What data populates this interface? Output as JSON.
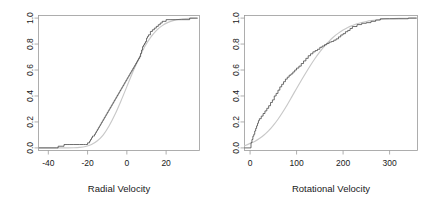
{
  "figure": {
    "background": "#ffffff",
    "ecdf_color": "#3d3d3d",
    "fitted_color": "#c8c8c8",
    "axis_color": "#9a9a9a"
  },
  "chart_data": [
    {
      "type": "line",
      "panel": "left",
      "title": "",
      "xlabel": "Radial Velocity",
      "ylabel": "",
      "xlim": [
        -45,
        37
      ],
      "ylim": [
        -0.02,
        1.02
      ],
      "xticks": [
        -40,
        -20,
        0,
        20
      ],
      "xticklabels": [
        "-40",
        "-20",
        "0",
        "20"
      ],
      "yticks": [
        0.0,
        0.2,
        0.4,
        0.6,
        0.8,
        1.0
      ],
      "yticklabels": [
        "0.0",
        "0.2",
        "0.4",
        "0.6",
        "0.8",
        "1.0"
      ],
      "grid": false,
      "legend": "none",
      "series": [
        {
          "name": "Empirical CDF",
          "kind": "step",
          "color": "#3d3d3d",
          "x": [
            -45,
            -36,
            -35,
            -33,
            -32,
            -31,
            -30,
            -29,
            -27,
            -24,
            -22,
            -21,
            -20,
            -19,
            -18.5,
            -18,
            -17.5,
            -17,
            -16.5,
            -16,
            -15.5,
            -15,
            -14.5,
            -14,
            -13.5,
            -13,
            -12.5,
            -12,
            -11.5,
            -11,
            -10.5,
            -10,
            -9.5,
            -9,
            -8.5,
            -8,
            -7.5,
            -7,
            -6.5,
            -6,
            -5.5,
            -5,
            -4.5,
            -4,
            -3.5,
            -3,
            -2.5,
            -2,
            -1.5,
            -1,
            -0.5,
            0,
            0.5,
            1,
            1.5,
            2,
            2.5,
            3,
            3.5,
            4,
            4.5,
            5,
            5.5,
            6,
            6.5,
            7,
            7.5,
            8,
            8.5,
            9,
            9.5,
            10,
            10.5,
            11,
            12,
            13,
            14,
            15,
            16,
            17,
            18,
            20,
            22,
            25,
            28,
            32,
            36
          ],
          "y": [
            0.0,
            0.0,
            0.013,
            0.013,
            0.026,
            0.026,
            0.026,
            0.026,
            0.026,
            0.026,
            0.026,
            0.026,
            0.039,
            0.052,
            0.065,
            0.078,
            0.091,
            0.091,
            0.104,
            0.117,
            0.13,
            0.143,
            0.156,
            0.169,
            0.182,
            0.195,
            0.208,
            0.221,
            0.234,
            0.247,
            0.26,
            0.273,
            0.286,
            0.299,
            0.312,
            0.325,
            0.338,
            0.351,
            0.364,
            0.377,
            0.39,
            0.403,
            0.416,
            0.429,
            0.442,
            0.455,
            0.468,
            0.481,
            0.494,
            0.507,
            0.52,
            0.533,
            0.546,
            0.559,
            0.572,
            0.585,
            0.598,
            0.611,
            0.624,
            0.637,
            0.65,
            0.663,
            0.676,
            0.689,
            0.702,
            0.728,
            0.754,
            0.78,
            0.793,
            0.806,
            0.819,
            0.845,
            0.858,
            0.871,
            0.897,
            0.91,
            0.923,
            0.936,
            0.949,
            0.962,
            0.975,
            0.988,
            0.988,
            0.988,
            0.988,
            1.0,
            1.0
          ]
        },
        {
          "name": "Fitted Normal CDF",
          "kind": "smooth",
          "color": "#c8c8c8",
          "mean": -0.6,
          "sd": 8.6,
          "x": [
            -45,
            -42,
            -39,
            -36,
            -33,
            -30,
            -27,
            -24,
            -21,
            -18,
            -15,
            -12,
            -9,
            -6,
            -3,
            0,
            3,
            6,
            9,
            12,
            15,
            18,
            21,
            24,
            27,
            30,
            33,
            36
          ],
          "y": [
            0.0,
            0.0,
            0.0,
            0.0,
            0.0,
            0.0,
            0.001,
            0.004,
            0.011,
            0.026,
            0.055,
            0.101,
            0.171,
            0.259,
            0.362,
            0.472,
            0.583,
            0.687,
            0.777,
            0.85,
            0.904,
            0.942,
            0.967,
            0.982,
            0.991,
            0.996,
            0.998,
            0.999
          ]
        }
      ]
    },
    {
      "type": "line",
      "panel": "right",
      "title": "",
      "xlabel": "Rotational Velocity",
      "ylabel": "",
      "xlim": [
        -12,
        360
      ],
      "ylim": [
        -0.02,
        1.02
      ],
      "xticks": [
        0,
        100,
        200,
        300
      ],
      "xticklabels": [
        "0",
        "100",
        "200",
        "300"
      ],
      "yticks": [
        0.0,
        0.2,
        0.4,
        0.6,
        0.8,
        1.0
      ],
      "yticklabels": [
        "0.0",
        "0.2",
        "0.4",
        "0.6",
        "0.8",
        "1.0"
      ],
      "grid": false,
      "legend": "none",
      "series": [
        {
          "name": "Empirical CDF",
          "kind": "step",
          "color": "#3d3d3d",
          "x": [
            -12,
            0,
            2,
            4,
            6,
            8,
            10,
            12,
            14,
            16,
            18,
            20,
            24,
            28,
            32,
            36,
            40,
            44,
            48,
            52,
            56,
            60,
            64,
            68,
            72,
            76,
            80,
            84,
            88,
            92,
            96,
            100,
            105,
            110,
            115,
            120,
            125,
            130,
            135,
            140,
            145,
            150,
            155,
            160,
            165,
            170,
            175,
            180,
            185,
            190,
            195,
            200,
            205,
            210,
            215,
            220,
            230,
            240,
            250,
            260,
            270,
            280,
            300,
            320,
            340,
            358
          ],
          "y": [
            0.0,
            0.0,
            0.04,
            0.065,
            0.09,
            0.105,
            0.13,
            0.15,
            0.17,
            0.19,
            0.21,
            0.225,
            0.245,
            0.265,
            0.285,
            0.305,
            0.325,
            0.35,
            0.37,
            0.4,
            0.42,
            0.445,
            0.47,
            0.49,
            0.51,
            0.53,
            0.545,
            0.56,
            0.57,
            0.585,
            0.6,
            0.615,
            0.63,
            0.65,
            0.67,
            0.69,
            0.71,
            0.725,
            0.74,
            0.75,
            0.76,
            0.775,
            0.785,
            0.795,
            0.805,
            0.815,
            0.82,
            0.83,
            0.84,
            0.855,
            0.87,
            0.88,
            0.895,
            0.905,
            0.92,
            0.935,
            0.95,
            0.96,
            0.965,
            0.975,
            0.985,
            0.995,
            0.995,
            0.995,
            1.0,
            1.0
          ]
        },
        {
          "name": "Fitted Normal CDF",
          "kind": "smooth",
          "color": "#c8c8c8",
          "mean": 113,
          "sd": 62,
          "x": [
            -12,
            0,
            10,
            20,
            30,
            40,
            50,
            60,
            70,
            80,
            90,
            100,
            110,
            120,
            130,
            140,
            150,
            160,
            170,
            180,
            190,
            200,
            210,
            220,
            230,
            240,
            250,
            260,
            280,
            300,
            320,
            340,
            358
          ],
          "y": [
            0.015,
            0.035,
            0.05,
            0.072,
            0.099,
            0.133,
            0.174,
            0.221,
            0.275,
            0.333,
            0.395,
            0.458,
            0.519,
            0.579,
            0.637,
            0.691,
            0.74,
            0.784,
            0.823,
            0.856,
            0.884,
            0.908,
            0.928,
            0.943,
            0.956,
            0.966,
            0.974,
            0.98,
            0.989,
            0.995,
            0.998,
            0.999,
            1.0
          ]
        }
      ]
    }
  ]
}
